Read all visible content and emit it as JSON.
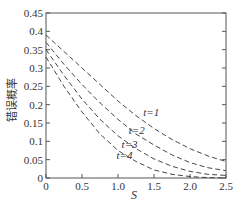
{
  "chart_data": {
    "type": "line",
    "title": "",
    "xlabel": "S",
    "ylabel": "错误概率",
    "xlim": [
      0,
      2.5
    ],
    "ylim": [
      0,
      0.45
    ],
    "xticks": [
      "0",
      "0.5",
      "1.0",
      "1.5",
      "2.0",
      "2.5"
    ],
    "yticks": [
      "0",
      "0.05",
      "0.1",
      "0.15",
      "0.2",
      "0.25",
      "0.3",
      "0.35",
      "0.4",
      "0.45"
    ],
    "grid": false,
    "line_style": "dashed",
    "x": [
      0,
      0.25,
      0.5,
      0.75,
      1.0,
      1.25,
      1.5,
      1.75,
      2.0,
      2.25,
      2.5
    ],
    "series": [
      {
        "name": "t=1",
        "values": [
          0.39,
          0.345,
          0.3,
          0.255,
          0.21,
          0.17,
          0.135,
          0.105,
          0.08,
          0.06,
          0.045
        ]
      },
      {
        "name": "t=2",
        "values": [
          0.37,
          0.31,
          0.255,
          0.205,
          0.16,
          0.12,
          0.09,
          0.063,
          0.042,
          0.028,
          0.02
        ]
      },
      {
        "name": "t=3",
        "values": [
          0.35,
          0.28,
          0.215,
          0.16,
          0.115,
          0.08,
          0.052,
          0.032,
          0.018,
          0.01,
          0.007
        ]
      },
      {
        "name": "t=4",
        "values": [
          0.33,
          0.25,
          0.18,
          0.12,
          0.075,
          0.045,
          0.022,
          0.01,
          0.004,
          0.001,
          0.0
        ]
      }
    ],
    "annotations": [
      {
        "text": "t=1",
        "x": 1.35,
        "y": 0.17
      },
      {
        "text": "t=2",
        "x": 1.15,
        "y": 0.12
      },
      {
        "text": "t=3",
        "x": 1.05,
        "y": 0.083
      },
      {
        "text": "t=4",
        "x": 0.98,
        "y": 0.053
      }
    ]
  }
}
